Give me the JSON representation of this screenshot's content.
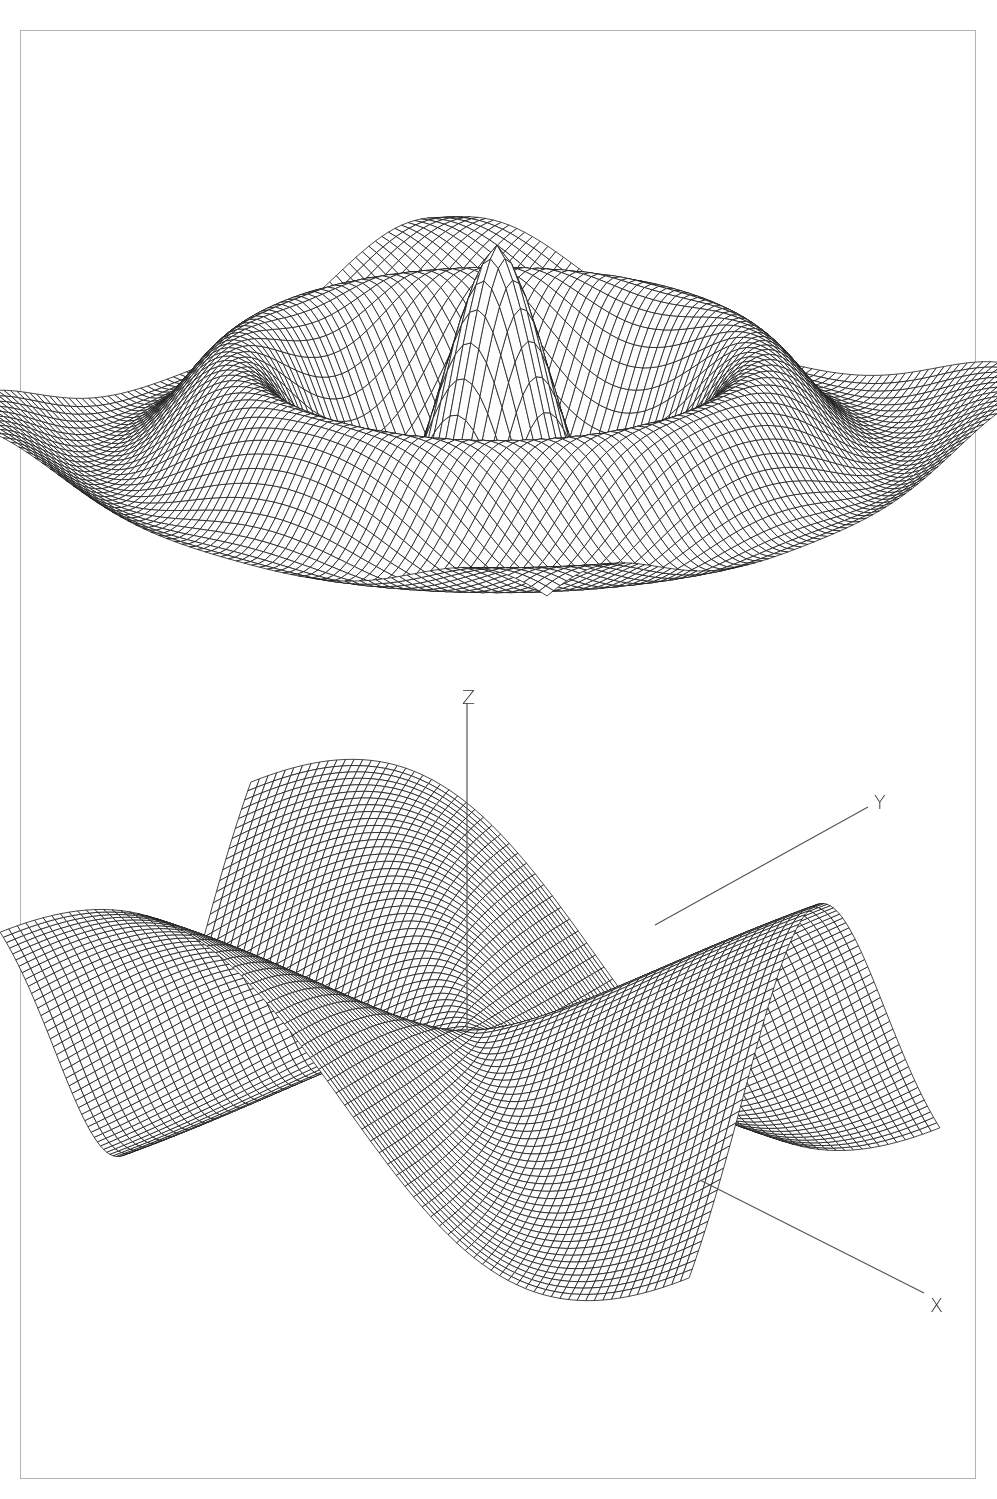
{
  "figure": {
    "frame_color": "#b4b4b4",
    "line_color": "#1a1a1a",
    "axis_color": "#555555"
  },
  "plots": [
    {
      "id": "ripple-surface",
      "type": "wireframe",
      "function": "radial damped cosine (sombrero-like ripple)",
      "grid": 80,
      "extent": 1.0,
      "center": [
        497,
        420
      ],
      "scale": 520,
      "z_scale": 360,
      "rot_deg": 40,
      "tilt_deg": 62
    },
    {
      "id": "saddle-surface",
      "type": "wireframe",
      "function": "monkey saddle r^3 cos(3θ) with damping",
      "grid": 80,
      "extent": 1.0,
      "center": [
        470,
        1030
      ],
      "scale": 470,
      "z_scale": 330,
      "rot_deg": 20,
      "tilt_deg": 72
    }
  ],
  "axes": {
    "z": {
      "label": "Z",
      "x": 462,
      "y": 688,
      "line": [
        467,
        703,
        467,
        1030
      ]
    },
    "y": {
      "label": "Y",
      "x": 874,
      "y": 793,
      "line": [
        655,
        925,
        868,
        807
      ]
    },
    "x": {
      "label": "X",
      "x": 930,
      "y": 1296,
      "line": [
        700,
        1180,
        924,
        1293
      ]
    }
  }
}
